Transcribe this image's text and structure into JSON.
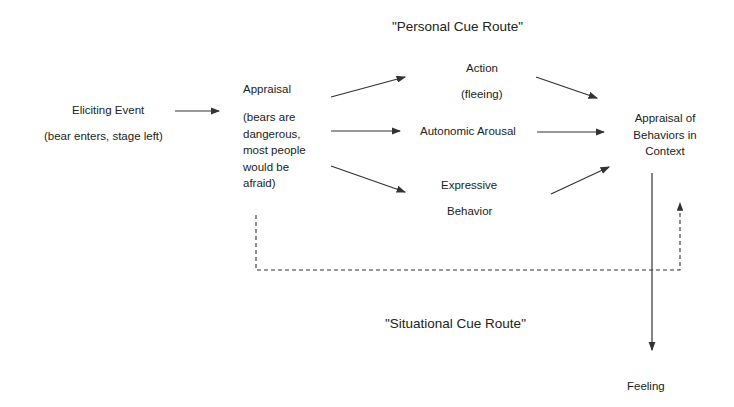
{
  "diagram": {
    "routes": {
      "personal": "\"Personal Cue Route\"",
      "situational": "\"Situational Cue Route\""
    },
    "eliciting_event": {
      "title": "Eliciting Event",
      "detail": "(bear enters, stage left)"
    },
    "appraisal": {
      "title": "Appraisal",
      "detail_lines": [
        "(bears are",
        "dangerous,",
        "most people",
        "would be",
        "afraid)"
      ]
    },
    "action": {
      "title": "Action",
      "detail": "(fleeing)"
    },
    "autonomic_arousal": {
      "title": "Autonomic Arousal"
    },
    "expressive_behavior": {
      "lines": [
        "Expressive",
        "Behavior"
      ]
    },
    "appraisal_of_behaviors": {
      "lines": [
        "Appraisal of",
        "Behaviors in",
        "Context"
      ]
    },
    "feeling": {
      "title": "Feeling"
    },
    "colors": {
      "line": "#333333",
      "text": "#222222",
      "background": "#ffffff"
    }
  }
}
